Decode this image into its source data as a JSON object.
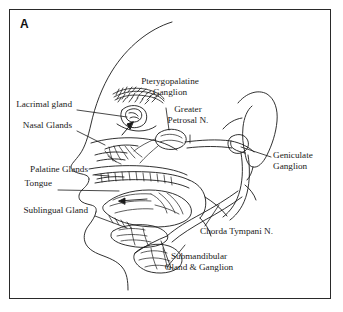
{
  "figure": {
    "panel_letter": "A",
    "border_color": "#2a2a2a",
    "ink_color": "#1a1a1a",
    "background": "#ffffff"
  },
  "labels": {
    "lacrimal_gland": "Lacrimal gland",
    "nasal_glands": "Nasal Glands",
    "palatine_glands": "Palatine Glands",
    "tongue": "Tongue",
    "sublingual_gland": "Sublingual Gland",
    "pterygopalatine_line1": "Pterygopalatine",
    "pterygopalatine_line2": "Ganglion",
    "greater_petrosal_line1": "Greater",
    "greater_petrosal_line2": "Petrosal N.",
    "geniculate_line1": "Geniculate",
    "geniculate_line2": "Ganglion",
    "chorda_tympani": "Chorda Tympani N.",
    "submandibular_line1": "Submandibular",
    "submandibular_line2": "Gland & Ganglion"
  }
}
